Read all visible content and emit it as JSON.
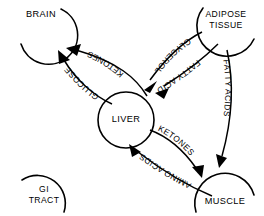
{
  "diagram": {
    "background_color": "#ffffff",
    "ink_color": "#000000",
    "width": 264,
    "height": 216
  },
  "nodes": [
    {
      "id": "brain",
      "label_line1": "BRAIN",
      "label_line2": "",
      "shape": "open-arc-circle",
      "opening": "upper-left"
    },
    {
      "id": "adipose",
      "label_line1": "ADIPOSE",
      "label_line2": "TISSUE",
      "shape": "open-arc-circle",
      "opening": "upper-right"
    },
    {
      "id": "liver",
      "label_line1": "LIVER",
      "label_line2": "",
      "shape": "closed-circle",
      "opening": "none"
    },
    {
      "id": "gi_tract",
      "label_line1": "GI",
      "label_line2": "TRACT",
      "shape": "open-arc-circle",
      "opening": "lower-left"
    },
    {
      "id": "muscle",
      "label_line1": "MUSCLE",
      "label_line2": "",
      "shape": "open-arc-circle",
      "opening": "bottom"
    }
  ],
  "flows": [
    {
      "id": "ketones-liver-to-brain",
      "label": "KETONES",
      "source": "liver",
      "target": "brain",
      "direction": "up-left"
    },
    {
      "id": "glucose-liver-to-brain",
      "label": "GLUCOSE",
      "source": "liver",
      "target": "brain",
      "direction": "up-left"
    },
    {
      "id": "glycerol-adipose-to-liver",
      "label": "GLYCEROL",
      "source": "adipose",
      "target": "liver",
      "direction": "down-left"
    },
    {
      "id": "fatty-acids-adipose-to-liver",
      "label": "FATTY ACIDS",
      "source": "adipose",
      "target": "liver",
      "direction": "down-left"
    },
    {
      "id": "fatty-acids-adipose-to-muscle",
      "label": "FATTY ACIDS",
      "source": "adipose",
      "target": "muscle",
      "direction": "down"
    },
    {
      "id": "ketones-liver-to-muscle",
      "label": "KETONES",
      "source": "liver",
      "target": "muscle",
      "direction": "down-right"
    },
    {
      "id": "amino-acids-muscle-to-liver",
      "label": "AMINO ACIDS",
      "source": "muscle",
      "target": "liver",
      "direction": "up-left"
    }
  ]
}
